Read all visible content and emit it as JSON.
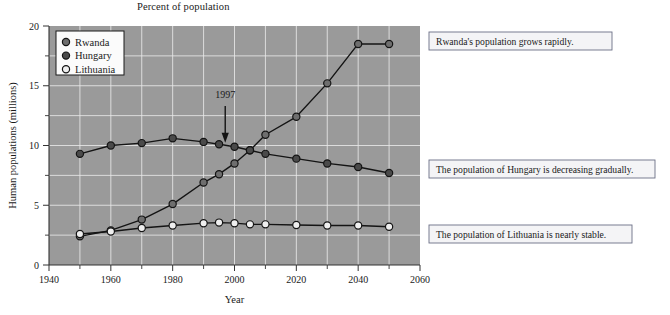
{
  "top_caption": "Percent of population",
  "chart_data": {
    "type": "line",
    "title": "",
    "xlabel": "Year",
    "ylabel": "Human populations (millions)",
    "xlim": [
      1940,
      2060
    ],
    "ylim": [
      0,
      20
    ],
    "x_ticks": [
      1940,
      1960,
      1980,
      2000,
      2020,
      2040,
      2060
    ],
    "x_tick_labels": [
      "1940",
      "1960",
      "1980",
      "2000",
      "2020",
      "2040",
      "2060"
    ],
    "x_minor_ticks": [
      1950,
      1970,
      1990,
      2010,
      2030,
      2050
    ],
    "y_ticks": [
      0,
      5,
      10,
      15,
      20
    ],
    "y_tick_labels": [
      "0",
      "5",
      "10",
      "15",
      "20"
    ],
    "y_minor_ticks": [
      2.5,
      7.5,
      12.5,
      17.5
    ],
    "grid": true,
    "grid_color": "#e8e8e8",
    "plot_background": "#9a9a9a",
    "legend_position": "top-left",
    "x": [
      1950,
      1960,
      1970,
      1980,
      1990,
      1995,
      2000,
      2005,
      2010,
      2020,
      2030,
      2040,
      2050
    ],
    "series": [
      {
        "name": "Rwanda",
        "marker": "filled-gray",
        "color": "#6e6e6e",
        "values": [
          2.4,
          2.9,
          3.8,
          5.1,
          6.9,
          7.6,
          8.5,
          9.6,
          10.9,
          12.4,
          15.2,
          18.5,
          18.5
        ]
      },
      {
        "name": "Hungary",
        "marker": "filled-dark",
        "color": "#4a4a4a",
        "values": [
          9.3,
          10.0,
          10.2,
          10.6,
          10.3,
          10.1,
          9.9,
          9.6,
          9.3,
          8.9,
          8.5,
          8.2,
          7.7
        ]
      },
      {
        "name": "Lithuania",
        "marker": "open",
        "color": "#efefef",
        "values": [
          2.6,
          2.8,
          3.1,
          3.3,
          3.5,
          3.55,
          3.5,
          3.4,
          3.4,
          3.35,
          3.3,
          3.3,
          3.2
        ]
      }
    ],
    "annotation": {
      "label": "1997",
      "x": 1997,
      "y": 9.9
    }
  },
  "legend": {
    "items": [
      {
        "label": "Rwanda"
      },
      {
        "label": "Hungary"
      },
      {
        "label": "Lithuania"
      }
    ]
  },
  "callouts": [
    {
      "text": "Rwanda's population grows rapidly."
    },
    {
      "text": "The population of Hungary is decreasing gradually."
    },
    {
      "text": "The population of Lithuania is nearly stable."
    }
  ]
}
